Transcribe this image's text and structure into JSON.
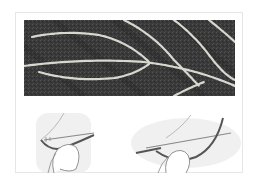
{
  "figure": {
    "photo": {
      "subject": "embroidery-stem-stitch-on-dark-fabric",
      "background_color": "#3c3c3c",
      "stitch_color": "#d8d8d0"
    },
    "illustrations": [
      {
        "subject": "needle-through-fabric-with-thumb-holding-thread",
        "position": "left"
      },
      {
        "subject": "needle-pulled-through-with-thread-loop-under-thumb",
        "position": "right"
      }
    ],
    "colors": {
      "card_border": "#e6e6e6",
      "shadow": "#e8e8e8",
      "thread": "#555555",
      "line": "#888888"
    }
  }
}
